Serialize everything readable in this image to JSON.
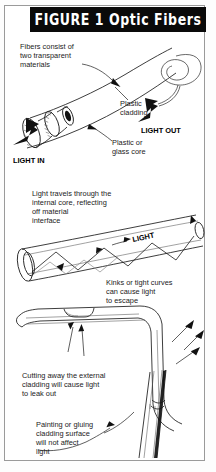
{
  "figure": {
    "title_label": "FIGURE 1",
    "title_subject": "Optic Fibers",
    "title_full": "FIGURE 1  Optic Fibers",
    "title_bar_color": "#0a0a0a",
    "title_text_color": "#ffffff",
    "frame_border_color": "#9a9a9a",
    "background_color": "#ffffff",
    "ink_color": "#1b1b1b"
  },
  "panels": {
    "top": {
      "name": "fiber-construction",
      "captions": {
        "construction": "Fibers consist of\ntwo transparent\nmaterials",
        "construction_l1": "Fibers consist of",
        "construction_l2": "two transparent",
        "construction_l3": "materials",
        "cladding_l1": "Plastic",
        "cladding_l2": "cladding",
        "core_l1": "Plastic or",
        "core_l2": "glass core",
        "light_in": "LIGHT IN",
        "light_out": "LIGHT OUT"
      }
    },
    "middle": {
      "name": "internal-reflection",
      "captions": {
        "reflection_l1": "Light travels through the",
        "reflection_l2": "internal core, reflecting",
        "reflection_l3": "off material",
        "reflection_l4": "interface",
        "light": "LIGHT"
      }
    },
    "bent": {
      "name": "kinks-and-cut-cladding",
      "captions": {
        "kinks_l1": "Kinks or tight curves",
        "kinks_l2": "can cause light",
        "kinks_l3": "to escape",
        "cutting_l1": "Cutting away the external",
        "cutting_l2": "cladding will cause light",
        "cutting_l3": "to leak out"
      }
    },
    "bottom": {
      "name": "painted-cladding",
      "captions": {
        "painting_l1": "Painting or gluing",
        "painting_l2": "cladding surface",
        "painting_l3": "will not affect",
        "painting_l4": "light"
      }
    }
  }
}
